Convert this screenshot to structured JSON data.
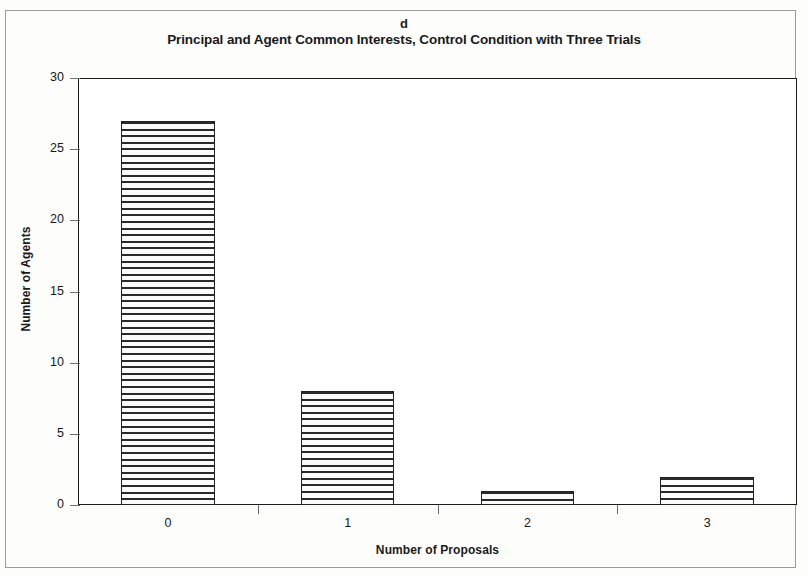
{
  "figure": {
    "panel_label": "d",
    "title": "Principal and Agent Common Interests, Control Condition with Three Trials",
    "frame_color": "#9a9a9a",
    "axis_color": "#1a1a1a",
    "bar_fill": "#fbfbfb",
    "bar_hatch_color": "#2a2a2a"
  },
  "chart_data": {
    "type": "bar",
    "title": "Principal and Agent Common Interests, Control Condition with Three Trials",
    "panel_label": "d",
    "categories": [
      "0",
      "1",
      "2",
      "3"
    ],
    "values": [
      27,
      8,
      1,
      2
    ],
    "xlabel": "Number of Proposals",
    "ylabel": "Number of Agents",
    "ylim": [
      0,
      30
    ],
    "ytick_labels": [
      "0",
      "5",
      "10",
      "15",
      "20",
      "25",
      "30"
    ],
    "ytick_values": [
      0,
      5,
      10,
      15,
      20,
      25,
      30
    ],
    "xtick_labels": [
      "0",
      "1",
      "2",
      "3"
    ],
    "grid": false,
    "legend": null,
    "bar_style": "horizontal-line-hatch"
  }
}
